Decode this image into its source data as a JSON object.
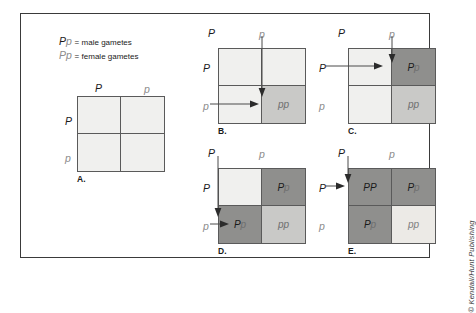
{
  "figure": {
    "credit": "© Kendall/Hunt Publishing",
    "legend": [
      {
        "dominant": "P",
        "recessive": "p",
        "equals": "=",
        "text": "male gametes"
      },
      {
        "dominant": "P",
        "recessive": "p",
        "equals": "=",
        "text": "female gametes"
      }
    ]
  },
  "panels": [
    {
      "id": "A",
      "letter": "A.",
      "col_headers": [
        "P",
        "p"
      ],
      "row_headers": [
        "P",
        "p"
      ],
      "cells": [
        {
          "pos": "top-left",
          "text": "",
          "fill": "empty"
        },
        {
          "pos": "top-right",
          "text": "",
          "fill": "empty"
        },
        {
          "pos": "bottom-left",
          "text": "",
          "fill": "empty"
        },
        {
          "pos": "bottom-right",
          "text": "",
          "fill": "empty"
        }
      ],
      "arrows": []
    },
    {
      "id": "B",
      "letter": "B.",
      "col_headers": [
        "P",
        "p"
      ],
      "row_headers": [
        "P",
        "p"
      ],
      "cells": [
        {
          "pos": "top-left",
          "text": "",
          "fill": "empty"
        },
        {
          "pos": "top-right",
          "text": "",
          "fill": "empty"
        },
        {
          "pos": "bottom-left",
          "text": "",
          "fill": "empty"
        },
        {
          "pos": "bottom-right",
          "text": "pp",
          "fill": "mid"
        }
      ],
      "arrows": [
        "column-p-down",
        "row-p-right"
      ]
    },
    {
      "id": "C",
      "letter": "C.",
      "col_headers": [
        "P",
        "p"
      ],
      "row_headers": [
        "P",
        "p"
      ],
      "cells": [
        {
          "pos": "top-left",
          "text": "",
          "fill": "empty"
        },
        {
          "pos": "top-right",
          "text": "Pp",
          "fill": "dark"
        },
        {
          "pos": "bottom-left",
          "text": "",
          "fill": "empty"
        },
        {
          "pos": "bottom-right",
          "text": "pp",
          "fill": "mid"
        }
      ],
      "arrows": [
        "column-p-down",
        "row-P-right"
      ]
    },
    {
      "id": "D",
      "letter": "D.",
      "col_headers": [
        "P",
        "p"
      ],
      "row_headers": [
        "P",
        "p"
      ],
      "cells": [
        {
          "pos": "top-left",
          "text": "",
          "fill": "empty"
        },
        {
          "pos": "top-right",
          "text": "Pp",
          "fill": "dark"
        },
        {
          "pos": "bottom-left",
          "text": "Pp",
          "fill": "dark"
        },
        {
          "pos": "bottom-right",
          "text": "pp",
          "fill": "mid"
        }
      ],
      "arrows": [
        "column-P-down",
        "row-p-right"
      ]
    },
    {
      "id": "E",
      "letter": "E.",
      "col_headers": [
        "P",
        "p"
      ],
      "row_headers": [
        "P",
        "p"
      ],
      "cells": [
        {
          "pos": "top-left",
          "text": "PP",
          "fill": "dark"
        },
        {
          "pos": "top-right",
          "text": "Pp",
          "fill": "dark"
        },
        {
          "pos": "bottom-left",
          "text": "Pp",
          "fill": "dark"
        },
        {
          "pos": "bottom-right",
          "text": "pp",
          "fill": "mid"
        }
      ],
      "arrows": [
        "column-P-down",
        "row-P-right"
      ]
    }
  ]
}
